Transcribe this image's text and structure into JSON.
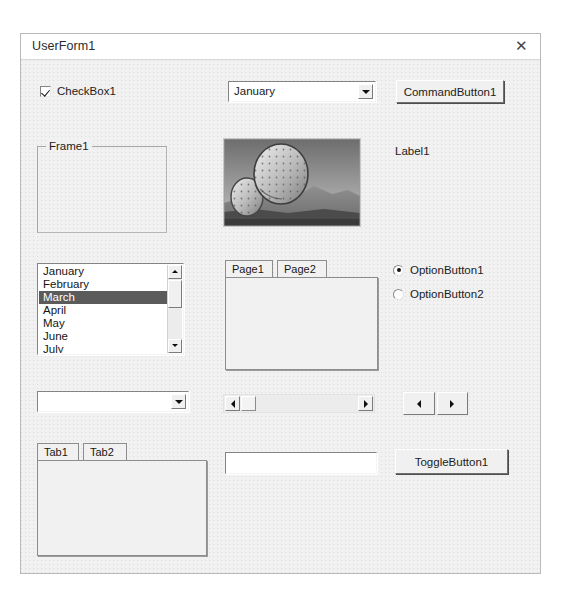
{
  "window": {
    "title": "UserForm1",
    "close_icon": "close-icon"
  },
  "controls": {
    "checkbox": {
      "label": "CheckBox1",
      "checked": true
    },
    "combobox_top": {
      "value": "January",
      "placeholder": "",
      "dropdown_icon": "chevron-down-icon"
    },
    "command_button": {
      "label": "CommandButton1"
    },
    "frame": {
      "caption": "Frame1"
    },
    "image": {
      "alt": "cactus-desert-photo"
    },
    "label": {
      "text": "Label1"
    },
    "listbox": {
      "items": [
        "January",
        "February",
        "March",
        "April",
        "May",
        "June",
        "July"
      ],
      "selected": "March",
      "scroll_up_icon": "triangle-up-icon",
      "scroll_down_icon": "triangle-down-icon"
    },
    "multipage": {
      "tabs": [
        "Page1",
        "Page2"
      ],
      "active": "Page1"
    },
    "option_buttons": [
      {
        "label": "OptionButton1",
        "selected": true
      },
      {
        "label": "OptionButton2",
        "selected": false
      }
    ],
    "combobox_bottom": {
      "value": "",
      "placeholder": "",
      "dropdown_icon": "chevron-down-icon"
    },
    "scrollbar": {
      "left_icon": "triangle-left-icon",
      "right_icon": "triangle-right-icon"
    },
    "spinbutton": {
      "left_icon": "triangle-left-icon",
      "right_icon": "triangle-right-icon"
    },
    "tabstrip": {
      "tabs": [
        "Tab1",
        "Tab2"
      ],
      "active": "Tab1"
    },
    "textbox": {
      "value": "",
      "placeholder": ""
    },
    "toggle_button": {
      "label": "ToggleButton1",
      "pressed": false
    }
  }
}
